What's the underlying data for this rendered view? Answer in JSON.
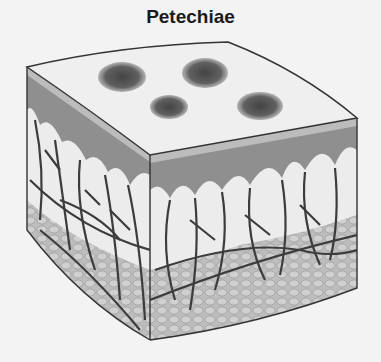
{
  "title": "Petechiae",
  "diagram": {
    "layers": [
      "epidermis surface",
      "epidermis",
      "dermis with capillaries",
      "subcutaneous fat"
    ],
    "surface_spots": 4,
    "colors": {
      "background": "#f3f3f3",
      "surface": "#efefef",
      "epidermis": "#8f8f8f",
      "dermis": "#ebebeb",
      "vessels": "#3c3c3c",
      "fat": "#b9b9b9",
      "spot": "#5a5a5a"
    }
  }
}
